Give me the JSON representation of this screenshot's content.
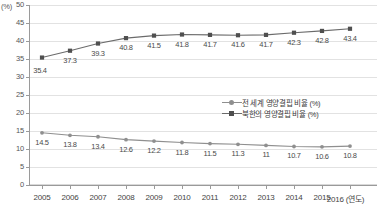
{
  "chart_data": {
    "type": "line",
    "title": "",
    "subtitle": "",
    "xlabel": "2016 (연도)",
    "ylabel": "(%)",
    "unit_label": "(%)",
    "grid": true,
    "legend_position": "inside-right-middle",
    "ylim": [
      0,
      50
    ],
    "ytick_step": 5,
    "yticks": [
      "50",
      "45",
      "40",
      "35",
      "30",
      "25",
      "20",
      "15",
      "10",
      "5",
      "0"
    ],
    "categories": [
      "2005",
      "2006",
      "2007",
      "2008",
      "2009",
      "2010",
      "2011",
      "2012",
      "2013",
      "2014",
      "2015",
      "2016"
    ],
    "xtick_labels": [
      "2005",
      "2006",
      "2007",
      "2008",
      "2009",
      "2010",
      "2011",
      "2012",
      "2013",
      "2014",
      "2015",
      "2016 (연도)"
    ],
    "series": [
      {
        "name": "북한의 영양결핍 비율 (%)",
        "color": "#6b6b6b",
        "marker": "square",
        "values": [
          35.4,
          37.3,
          39.3,
          40.8,
          41.5,
          41.8,
          41.7,
          41.6,
          41.7,
          42.3,
          42.8,
          43.4
        ],
        "labels": [
          "35.4",
          "37.3",
          "39.3",
          "40.8",
          "41.5",
          "41.8",
          "41.7",
          "41.6",
          "41.7",
          "42.3",
          "42.8",
          "43.4"
        ]
      },
      {
        "name": "전 세계 영양결핍 비율 (%)",
        "color": "#8f8f8f",
        "marker": "circle",
        "values": [
          14.5,
          13.8,
          13.4,
          12.6,
          12.2,
          11.8,
          11.5,
          11.3,
          11.0,
          10.7,
          10.6,
          10.8
        ],
        "labels": [
          "14.5",
          "13.8",
          "13.4",
          "12.6",
          "12.2",
          "11.8",
          "11.5",
          "11.3",
          "11",
          "10.7",
          "10.6",
          "10.8"
        ]
      }
    ]
  },
  "legend": {
    "items": [
      {
        "label": "전 세계 영양결핍 비율 (%)",
        "color": "#8f8f8f",
        "marker": "circle"
      },
      {
        "label": "북한의 영양결핍 비율 (%)",
        "color": "#6b6b6b",
        "marker": "square"
      }
    ]
  }
}
